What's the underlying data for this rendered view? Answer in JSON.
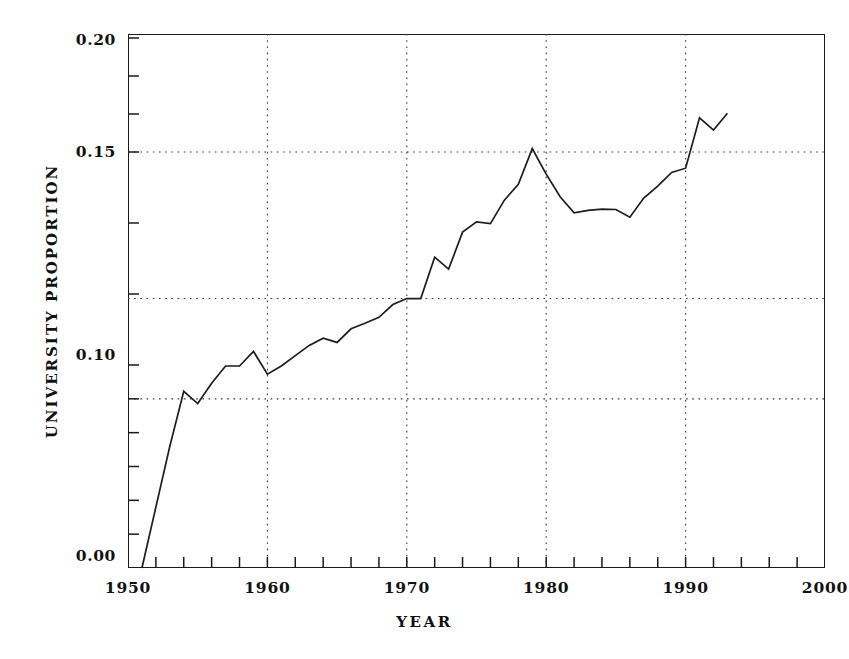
{
  "chart_data": {
    "type": "line",
    "title": "",
    "xlabel": "YEAR",
    "ylabel": "UNIVERSITY PROPORTION",
    "xlim": [
      1950,
      2000
    ],
    "ylim": [
      0.0,
      0.2
    ],
    "grid": true,
    "legend": null,
    "x_ticklabels": [
      "1950",
      "1960",
      "1970",
      "1980",
      "1990",
      "2000"
    ],
    "x_ticks": [
      1950,
      1960,
      1970,
      1980,
      1990,
      2000
    ],
    "x_minor_tick_interval": 2,
    "y_ticklabels": [
      "0.00",
      "0.10",
      "0.15",
      "0.20"
    ],
    "y_ticks": [
      0.0,
      0.1,
      0.15,
      0.2
    ],
    "gridline_values": [
      0.0833,
      0.1156,
      0.15
    ],
    "line_color": "#1d1d1d",
    "x": [
      1951,
      1952,
      1953,
      1954,
      1955,
      1956,
      1957,
      1958,
      1959,
      1960,
      1961,
      1962,
      1963,
      1964,
      1965,
      1966,
      1967,
      1968,
      1969,
      1970,
      1971,
      1972,
      1973,
      1974,
      1975,
      1976,
      1977,
      1978,
      1979,
      1980,
      1981,
      1982,
      1983,
      1984,
      1985,
      1986,
      1987,
      1988,
      1989,
      1990,
      1991,
      1992,
      1993
    ],
    "values": [
      0.0,
      0.03,
      0.06,
      0.087,
      0.081,
      0.091,
      0.0995,
      0.0995,
      0.1032,
      0.0955,
      0.0995,
      0.1022,
      0.1046,
      0.1063,
      0.1053,
      0.1085,
      0.1098,
      0.1112,
      0.1142,
      0.1156,
      0.1156,
      0.1253,
      0.1225,
      0.1312,
      0.1336,
      0.1332,
      0.1387,
      0.1424,
      0.1515,
      0.1448,
      0.1395,
      0.1357,
      0.1363,
      0.1366,
      0.1365,
      0.1347,
      0.1392,
      0.142,
      0.1452,
      0.1462,
      0.165,
      0.1596,
      0.167
    ]
  },
  "axes": {
    "y_tick_pixels": [
      568,
      365,
      152,
      38
    ],
    "y_label_pixels": [
      556,
      355,
      152,
      40
    ],
    "x_tick_pixels": [
      128,
      267,
      406,
      545,
      684,
      823
    ]
  }
}
